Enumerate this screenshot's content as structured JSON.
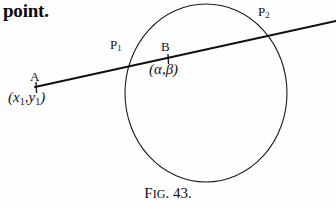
{
  "page": {
    "body_text": "point.",
    "background_color": "#fefefe",
    "ink_color": "#111111"
  },
  "figure": {
    "caption_prefix": "F",
    "caption_small": "IG",
    "caption_number": ". 43.",
    "caption_full": "FIG. 43.",
    "circle": {
      "cx": 206,
      "cy": 93,
      "rx": 81,
      "ry": 89,
      "stroke": "#1a1a1a",
      "stroke_width": 1.1,
      "fill": "none"
    },
    "secant_line": {
      "x1": 35,
      "y1": 87,
      "x2": 336,
      "y2": 21,
      "stroke": "#0f0f0f",
      "stroke_width": 1.8
    },
    "tick_marks": [
      {
        "name": "tick-A",
        "x": 36,
        "y1": 82,
        "y2": 93
      },
      {
        "name": "tick-B",
        "x": 168,
        "y1": 54,
        "y2": 64
      }
    ],
    "points": [
      {
        "id": "A",
        "label": "A",
        "x": 36,
        "y": 88
      },
      {
        "id": "P1",
        "label": "P",
        "sub": "1",
        "x": 131,
        "y": 67
      },
      {
        "id": "B",
        "label": "B",
        "x": 168,
        "y": 59
      },
      {
        "id": "P2",
        "label": "P",
        "sub": "2",
        "x": 278,
        "y": 35
      }
    ],
    "labels": {
      "P1": {
        "base": "P",
        "sub": "1"
      },
      "P2": {
        "base": "P",
        "sub": "2"
      },
      "A": "A",
      "B": "B",
      "A_coords": {
        "open": "(",
        "x_var": "x",
        "x_sub": "1",
        "comma": ",",
        "y_var": "y",
        "y_sub": "1",
        "close": ")"
      },
      "B_coords": {
        "open": "(",
        "alpha": "α",
        "comma": ",",
        "beta": "β",
        "close": ")"
      }
    }
  }
}
